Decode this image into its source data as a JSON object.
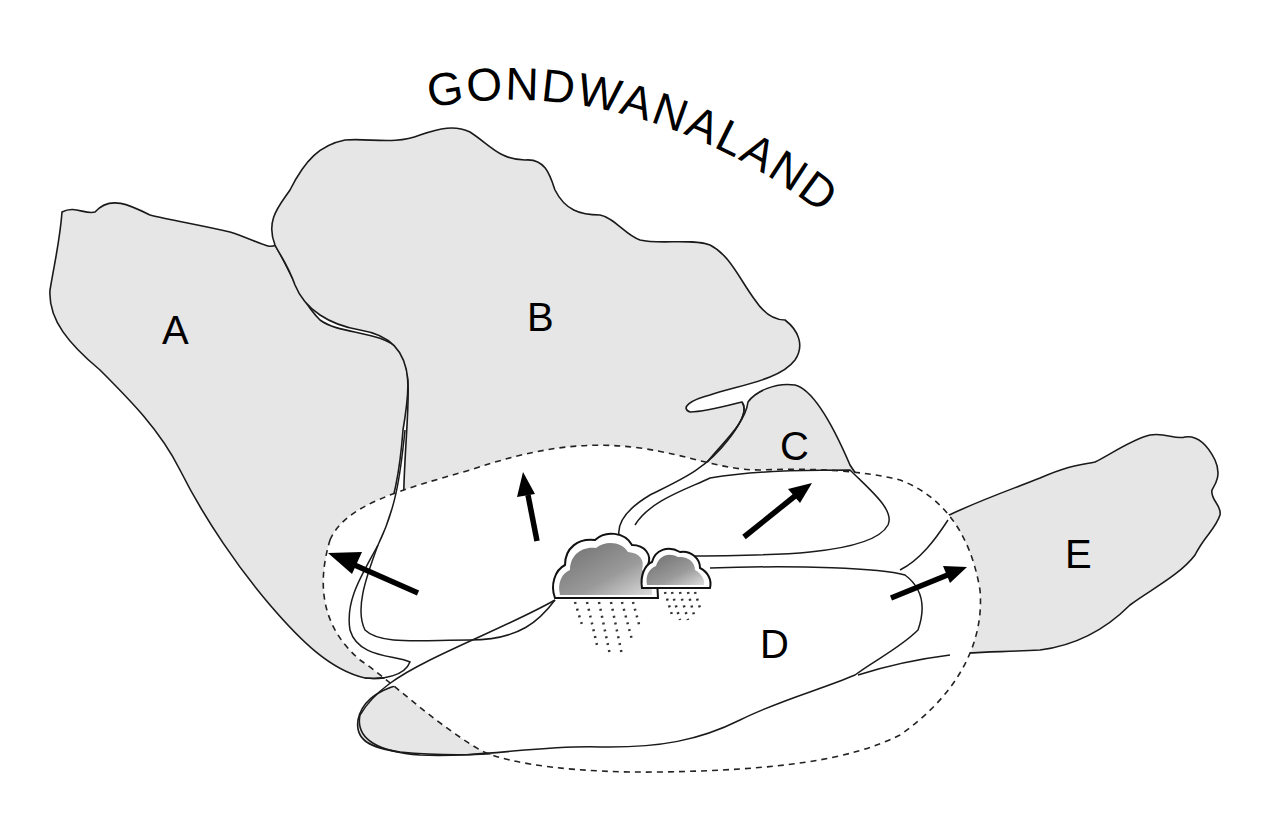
{
  "title": "GONDWANALAND",
  "regions": {
    "a": {
      "label": "A"
    },
    "b": {
      "label": "B"
    },
    "c": {
      "label": "C"
    },
    "d": {
      "label": "D"
    },
    "e": {
      "label": "E"
    }
  },
  "colors": {
    "land_fill": "#e6e6e6",
    "outline": "#1a1a1a",
    "background": "#ffffff",
    "cloud_dark": "#7a7a7a",
    "cloud_light": "#d8d8d8"
  },
  "elements": {
    "arrows": [
      {
        "name": "arrow-west",
        "direction": "west-northwest"
      },
      {
        "name": "arrow-north",
        "direction": "north"
      },
      {
        "name": "arrow-northeast",
        "direction": "northeast"
      },
      {
        "name": "arrow-east",
        "direction": "east-northeast"
      }
    ],
    "clouds": [
      {
        "name": "rain-cloud-large"
      },
      {
        "name": "rain-cloud-small"
      }
    ],
    "boundary": "dashed-outline"
  }
}
